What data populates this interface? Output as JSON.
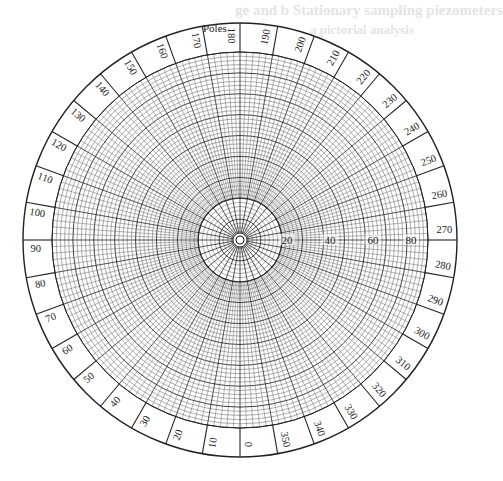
{
  "diagram": {
    "title_label": "Poles",
    "type": "polar equal-area net",
    "colors": {
      "background": "#ffffff",
      "ink": "#222222",
      "grid_minor": "#6a6a6a",
      "grid_major": "#2a2a2a",
      "bleed_through": "#e4e4e4"
    },
    "geometry": {
      "center_x": 240,
      "center_y": 240,
      "outer_radius": 217,
      "grid_radius": 188,
      "inner_zone_radius": 42,
      "hole_radius": 4
    },
    "azimuth_labels": [
      "0",
      "10",
      "20",
      "30",
      "40",
      "50",
      "60",
      "70",
      "80",
      "90",
      "100",
      "110",
      "120",
      "130",
      "140",
      "150",
      "160",
      "170",
      "180",
      "190",
      "200",
      "210",
      "220",
      "230",
      "240",
      "250",
      "260",
      "270",
      "280",
      "290",
      "300",
      "310",
      "320",
      "330",
      "340",
      "350"
    ],
    "azimuth_convention": "0 at bottom, increasing clockwise (90 left, 180 top, 270 right)",
    "radial_labels": [
      {
        "text": "20",
        "x": 287
      },
      {
        "text": "40",
        "x": 330
      },
      {
        "text": "60",
        "x": 373
      },
      {
        "text": "80",
        "x": 411
      }
    ],
    "bleed_through_text": [
      "ge and b Stationary sampling piezometers",
      "a pictorial analysis"
    ]
  }
}
